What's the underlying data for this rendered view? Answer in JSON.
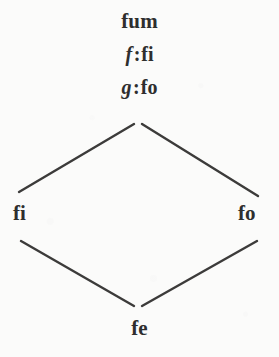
{
  "figure": {
    "type": "hasse-diagram",
    "shape": "diamond",
    "background_color": "#fbfbfa",
    "edge_color": "#3c3b3a",
    "text_color": "#2e2e2e"
  },
  "nodes": {
    "top": {
      "label": "fum",
      "assignments": [
        {
          "variable": "f",
          "separator": ":",
          "value": "fi"
        },
        {
          "variable": "g",
          "separator": ":",
          "value": "fo"
        }
      ]
    },
    "left": {
      "label": "fi"
    },
    "right": {
      "label": "fo"
    },
    "bottom": {
      "label": "fe"
    }
  },
  "edges": [
    {
      "from": "top",
      "to": "left",
      "x1": 134,
      "y1": 124,
      "x2": 19,
      "y2": 192
    },
    {
      "from": "top",
      "to": "right",
      "x1": 142,
      "y1": 124,
      "x2": 258,
      "y2": 196
    },
    {
      "from": "left",
      "to": "bottom",
      "x1": 21,
      "y1": 241,
      "x2": 134,
      "y2": 306
    },
    {
      "from": "right",
      "to": "bottom",
      "x1": 257,
      "y1": 241,
      "x2": 142,
      "y2": 306
    }
  ]
}
